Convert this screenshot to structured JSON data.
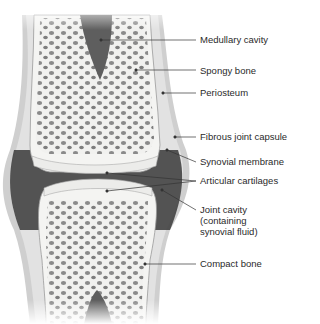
{
  "diagram": {
    "labels": [
      {
        "id": "medullary-cavity",
        "text": "Medullary cavity",
        "x": 200,
        "y": 34,
        "point": [
          101,
          40
        ]
      },
      {
        "id": "spongy-bone",
        "text": "Spongy bone",
        "x": 200,
        "y": 65,
        "point": [
          136,
          70
        ]
      },
      {
        "id": "periosteum",
        "text": "Periosteum",
        "x": 200,
        "y": 87,
        "point": [
          163,
          93
        ]
      },
      {
        "id": "fibrous-joint-capsule",
        "text": "Fibrous joint capsule",
        "x": 200,
        "y": 137,
        "point": [
          175,
          137
        ]
      },
      {
        "id": "synovial-membrane",
        "text": "Synovial membrane",
        "x": 200,
        "y": 162,
        "point": [
          167,
          150
        ]
      },
      {
        "id": "articular-cartilages",
        "text": "Articular cartilages",
        "x": 200,
        "y": 180,
        "points": [
          [
            107,
            173
          ],
          [
            107,
            191
          ]
        ]
      },
      {
        "id": "joint-cavity",
        "text": "Joint cavity\n(containing\nsynovial fluid)",
        "x": 200,
        "y": 209,
        "point": [
          162,
          190
        ]
      },
      {
        "id": "compact-bone",
        "text": "Compact bone",
        "x": 200,
        "y": 264,
        "point": [
          145,
          264
        ]
      }
    ]
  },
  "colors": {
    "bone": "#f1f1ef",
    "holes": "#8a8a8a",
    "cavity": "#5e5e5e",
    "capsule": "#c9c9c9",
    "dark_gap": "#3a3a3a",
    "leader": "#333333",
    "text": "#2a2a2a"
  }
}
